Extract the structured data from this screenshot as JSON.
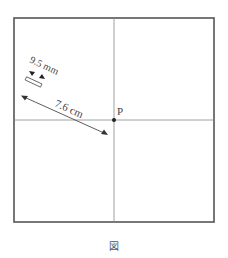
{
  "figure": {
    "caption": "図",
    "point_label": "P",
    "distance_label": "7.6 cm",
    "width_label": "9.5 mm",
    "colors": {
      "frame": "#555555",
      "line": "#888888",
      "arrow": "#333333"
    }
  }
}
